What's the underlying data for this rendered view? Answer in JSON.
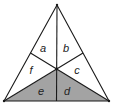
{
  "diagram": {
    "type": "triangle-medians",
    "vertices": {
      "apex": [
        57,
        5
      ],
      "bottom_left": [
        4,
        101
      ],
      "bottom_right": [
        109,
        101
      ]
    },
    "centroid": [
      56.7,
      69
    ],
    "midpoints": {
      "left": [
        30.5,
        53
      ],
      "right": [
        83,
        53
      ],
      "bottom": [
        56.5,
        101
      ]
    },
    "colors": {
      "shaded": "#a3a3a3",
      "unshaded": "#ffffff",
      "stroke": "#1a1a1a"
    },
    "regions": [
      {
        "label": "a",
        "shaded": false,
        "label_pos": [
          43,
          52
        ]
      },
      {
        "label": "b",
        "shaded": false,
        "label_pos": [
          66,
          52
        ]
      },
      {
        "label": "c",
        "shaded": false,
        "label_pos": [
          77,
          74
        ]
      },
      {
        "label": "d",
        "shaded": true,
        "label_pos": [
          67,
          95
        ]
      },
      {
        "label": "e",
        "shaded": true,
        "label_pos": [
          41,
          95
        ]
      },
      {
        "label": "f",
        "shaded": false,
        "label_pos": [
          31,
          74
        ]
      }
    ]
  }
}
